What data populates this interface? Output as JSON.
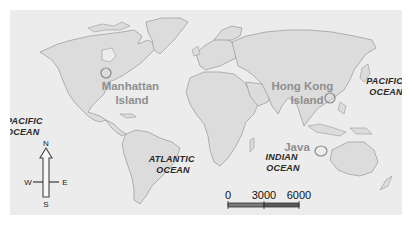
{
  "map": {
    "type": "world-map",
    "colors": {
      "ocean": "#ececec",
      "land": "#dcdcdc",
      "coastline": "#8a8a8a",
      "place_label": "#8f8f8f",
      "ocean_label": "#2a2a2a",
      "marker": "#8a8a8a"
    },
    "oceans": [
      {
        "id": "pacific-west",
        "lines": [
          "PACIFIC",
          "OCEAN"
        ]
      },
      {
        "id": "atlantic",
        "lines": [
          "ATLANTIC",
          "OCEAN"
        ]
      },
      {
        "id": "indian",
        "lines": [
          "INDIAN",
          "OCEAN"
        ]
      },
      {
        "id": "pacific-east",
        "lines": [
          "PACIFIC",
          "OCEAN"
        ]
      }
    ],
    "places": [
      {
        "id": "manhattan",
        "lines": [
          "Manhattan",
          "Island"
        ]
      },
      {
        "id": "hong-kong",
        "lines": [
          "Hong Kong",
          "Island"
        ]
      },
      {
        "id": "java",
        "lines": [
          "Java"
        ]
      }
    ],
    "compass": {
      "north": "N",
      "south": "S",
      "east": "E",
      "west": "W"
    },
    "scale_bar": {
      "ticks": [
        "0",
        "3000",
        "6000"
      ],
      "unit": "kilometres"
    }
  }
}
